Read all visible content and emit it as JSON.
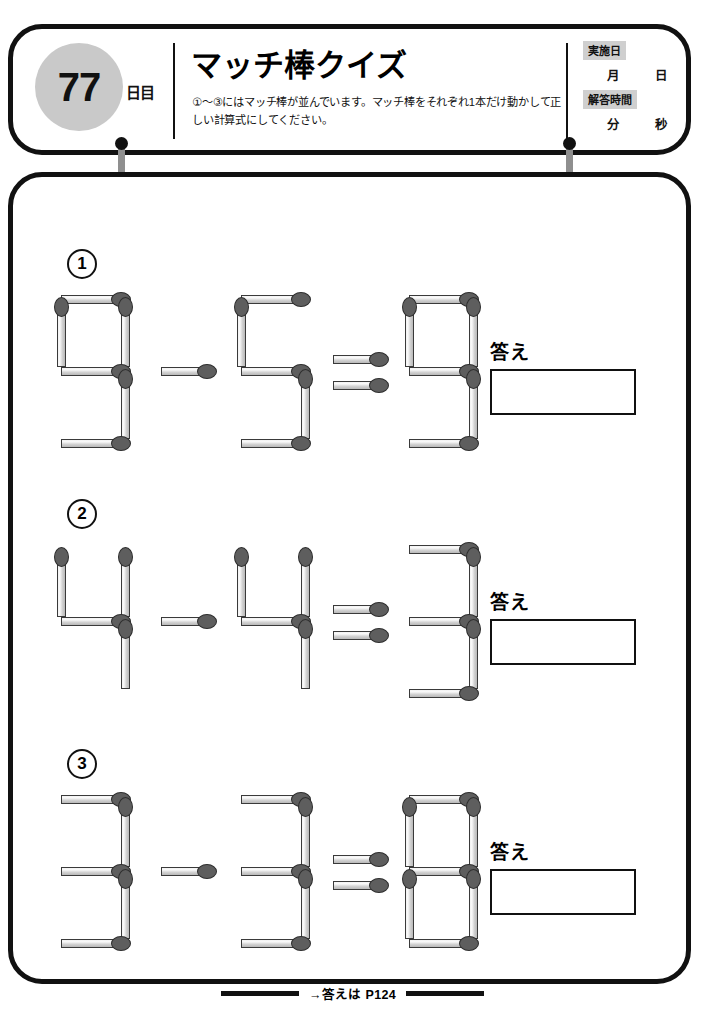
{
  "header": {
    "day_number": "77",
    "day_unit": "日目",
    "title": "マッチ棒クイズ",
    "instructions": "①〜③にはマッチ棒が並んでいます。マッチ棒をそれぞれ1本だけ動かして正しい計算式にしてください。",
    "meta": {
      "date_label": "実施日",
      "month_unit": "月",
      "day_unit": "日",
      "time_label": "解答時間",
      "minute_unit": "分",
      "second_unit": "秒"
    }
  },
  "puzzles": [
    {
      "number": "①",
      "number_plain": "1",
      "equation_text": "9-5=9",
      "operands": [
        "9",
        "5"
      ],
      "operator": "-",
      "result": "9",
      "answer_label": "答え",
      "answer_value": ""
    },
    {
      "number": "②",
      "number_plain": "2",
      "equation_text": "4-4=3",
      "operands": [
        "4",
        "4"
      ],
      "operator": "-",
      "result": "3",
      "answer_label": "答え",
      "answer_value": ""
    },
    {
      "number": "③",
      "number_plain": "3",
      "equation_text": "3-3=8",
      "operands": [
        "3",
        "3"
      ],
      "operator": "-",
      "result": "8",
      "answer_label": "答え",
      "answer_value": ""
    }
  ],
  "footer": {
    "text": "→答えは P124"
  },
  "colors": {
    "ink": "#111111",
    "badge_gray": "#c9c9c9",
    "tag_gray": "#cfcfcf",
    "match_head": "#5e5e5e",
    "match_body": "#dedede"
  }
}
